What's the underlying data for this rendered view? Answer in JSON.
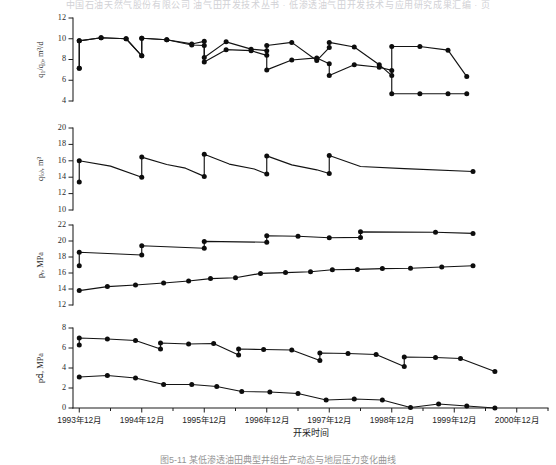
{
  "header": {
    "running_text": "中国石油天然气股份有限公司 油气田开发技术丛书 · 低渗透油气田开发技术与应用研究成果汇编 ·  页"
  },
  "figure": {
    "caption": "图5-11 某低渗透油田典型井组生产动态与地层压力变化曲线",
    "xaxis_title": "开采时间",
    "xtick_labels": [
      "1993年12月",
      "1994年12月",
      "1995年12月",
      "1996年12月",
      "1997年12月",
      "1998年12月",
      "1999年12月",
      "2000年12月"
    ]
  },
  "chart_data": [
    {
      "type": "line",
      "panel": 1,
      "title": "",
      "ylabel": "q₁/q₀,  m³/d",
      "xlabel": "",
      "ylim": [
        4,
        12
      ],
      "yticks": [
        4,
        6,
        8,
        10,
        12
      ],
      "xlim": [
        1993.9,
        2001.5
      ],
      "grid": false,
      "legend": "none",
      "x": [
        1994.0,
        1994.0,
        1994.35,
        1994.75,
        1995.0,
        1995.0,
        1995.4,
        1995.8,
        1996.0,
        1996.0,
        1996.35,
        1996.75,
        1997.0,
        1997.0,
        1997.4,
        1997.8,
        1998.0,
        1998.0,
        1998.4,
        1998.8,
        1999.0,
        1999.0,
        1999.45,
        1999.9,
        2000.2
      ],
      "series": [
        {
          "name": "upper",
          "values": [
            7.15,
            9.8,
            10.1,
            10.0,
            8.35,
            10.05,
            9.9,
            9.5,
            9.75,
            8.2,
            9.7,
            9.0,
            8.85,
            9.35,
            9.65,
            7.9,
            9.15,
            9.65,
            9.2,
            7.5,
            6.45,
            9.25,
            9.25,
            8.9,
            6.35
          ]
        },
        {
          "name": "lower",
          "values": [
            7.15,
            9.8,
            10.1,
            10.0,
            8.35,
            10.05,
            9.9,
            9.4,
            9.35,
            7.75,
            8.95,
            8.85,
            8.4,
            7.0,
            7.95,
            8.15,
            7.6,
            6.45,
            7.5,
            7.25,
            6.95,
            4.7,
            4.7,
            4.7,
            4.7
          ]
        }
      ]
    },
    {
      "type": "line",
      "panel": 2,
      "title": "",
      "ylabel": "q₍ₒ₎,  m³",
      "xlabel": "",
      "ylim": [
        10,
        20
      ],
      "yticks": [
        10,
        12,
        14,
        16,
        18,
        20
      ],
      "xlim": [
        1993.9,
        2001.5
      ],
      "grid": false,
      "legend": "none",
      "markers": [
        {
          "x": 1994.0,
          "y": 13.4
        },
        {
          "x": 1994.0,
          "y": 16.0
        },
        {
          "x": 1995.0,
          "y": 14.0
        },
        {
          "x": 1995.0,
          "y": 16.45
        },
        {
          "x": 1996.0,
          "y": 14.1
        },
        {
          "x": 1996.0,
          "y": 16.8
        },
        {
          "x": 1997.0,
          "y": 14.4
        },
        {
          "x": 1997.0,
          "y": 16.6
        },
        {
          "x": 1998.0,
          "y": 14.45
        },
        {
          "x": 1998.0,
          "y": 16.65
        },
        {
          "x": 2000.3,
          "y": 14.7
        }
      ],
      "path": [
        {
          "x": 1994.0,
          "y": 13.4
        },
        {
          "x": 1994.0,
          "y": 16.0
        },
        {
          "x": 1994.5,
          "y": 15.35
        },
        {
          "x": 1995.0,
          "y": 14.0
        },
        {
          "x": 1995.0,
          "y": 16.45
        },
        {
          "x": 1995.4,
          "y": 15.55
        },
        {
          "x": 1995.7,
          "y": 15.1
        },
        {
          "x": 1996.0,
          "y": 14.1
        },
        {
          "x": 1996.0,
          "y": 16.8
        },
        {
          "x": 1996.4,
          "y": 15.6
        },
        {
          "x": 1996.8,
          "y": 15.0
        },
        {
          "x": 1997.0,
          "y": 14.4
        },
        {
          "x": 1997.0,
          "y": 16.6
        },
        {
          "x": 1997.4,
          "y": 15.5
        },
        {
          "x": 1997.8,
          "y": 14.9
        },
        {
          "x": 1998.0,
          "y": 14.45
        },
        {
          "x": 1998.0,
          "y": 16.65
        },
        {
          "x": 1998.5,
          "y": 15.3
        },
        {
          "x": 1999.2,
          "y": 15.05
        },
        {
          "x": 2000.3,
          "y": 14.7
        }
      ]
    },
    {
      "type": "line",
      "panel": 3,
      "title": "",
      "ylabel": "pᵣ,  MPa",
      "xlabel": "",
      "ylim": [
        12,
        22
      ],
      "yticks": [
        12,
        14,
        16,
        18,
        20,
        22
      ],
      "xlim": [
        1993.9,
        2001.5
      ],
      "grid": false,
      "legend": "none",
      "series": [
        {
          "name": "upper-static-pressure",
          "points": [
            {
              "x": 1994.0,
              "y": 16.9
            },
            {
              "x": 1994.0,
              "y": 18.6
            },
            {
              "x": 1995.0,
              "y": 18.25
            },
            {
              "x": 1995.0,
              "y": 19.4
            },
            {
              "x": 1996.0,
              "y": 19.1
            },
            {
              "x": 1996.0,
              "y": 19.95
            },
            {
              "x": 1997.0,
              "y": 19.85
            },
            {
              "x": 1997.0,
              "y": 20.65
            },
            {
              "x": 1997.5,
              "y": 20.6
            },
            {
              "x": 1998.0,
              "y": 20.4
            },
            {
              "x": 1998.5,
              "y": 20.45
            },
            {
              "x": 1998.5,
              "y": 21.15
            },
            {
              "x": 1999.7,
              "y": 21.1
            },
            {
              "x": 2000.3,
              "y": 20.95
            }
          ]
        },
        {
          "name": "lower-flowing-pressure",
          "points": [
            {
              "x": 1994.0,
              "y": 13.8
            },
            {
              "x": 1994.45,
              "y": 14.3
            },
            {
              "x": 1994.9,
              "y": 14.5
            },
            {
              "x": 1995.35,
              "y": 14.75
            },
            {
              "x": 1995.75,
              "y": 15.0
            },
            {
              "x": 1996.1,
              "y": 15.3
            },
            {
              "x": 1996.5,
              "y": 15.4
            },
            {
              "x": 1996.9,
              "y": 15.95
            },
            {
              "x": 1997.3,
              "y": 16.05
            },
            {
              "x": 1997.7,
              "y": 16.15
            },
            {
              "x": 1998.05,
              "y": 16.4
            },
            {
              "x": 1998.45,
              "y": 16.45
            },
            {
              "x": 1998.85,
              "y": 16.55
            },
            {
              "x": 1999.3,
              "y": 16.6
            },
            {
              "x": 1999.8,
              "y": 16.75
            },
            {
              "x": 2000.3,
              "y": 16.9
            }
          ]
        }
      ]
    },
    {
      "type": "line",
      "panel": 4,
      "title": "",
      "ylabel": "p𝚍,  MPa",
      "xlabel": "开采时间",
      "ylim": [
        0,
        8
      ],
      "yticks": [
        0,
        2,
        4,
        6,
        8
      ],
      "xlim": [
        1993.9,
        2001.5
      ],
      "grid": false,
      "legend": "none",
      "series": [
        {
          "name": "upper-drawdown",
          "points": [
            {
              "x": 1994.0,
              "y": 6.3
            },
            {
              "x": 1994.0,
              "y": 7.0
            },
            {
              "x": 1994.45,
              "y": 6.9
            },
            {
              "x": 1994.9,
              "y": 6.75
            },
            {
              "x": 1995.3,
              "y": 5.9
            },
            {
              "x": 1995.3,
              "y": 6.5
            },
            {
              "x": 1995.75,
              "y": 6.4
            },
            {
              "x": 1996.15,
              "y": 6.45
            },
            {
              "x": 1996.55,
              "y": 5.3
            },
            {
              "x": 1996.55,
              "y": 5.9
            },
            {
              "x": 1996.95,
              "y": 5.85
            },
            {
              "x": 1997.4,
              "y": 5.8
            },
            {
              "x": 1997.85,
              "y": 4.75
            },
            {
              "x": 1997.85,
              "y": 5.5
            },
            {
              "x": 1998.3,
              "y": 5.45
            },
            {
              "x": 1998.75,
              "y": 5.35
            },
            {
              "x": 1999.2,
              "y": 4.15
            },
            {
              "x": 1999.2,
              "y": 5.1
            },
            {
              "x": 1999.7,
              "y": 5.05
            },
            {
              "x": 2000.1,
              "y": 4.95
            },
            {
              "x": 2000.65,
              "y": 3.65
            }
          ]
        },
        {
          "name": "lower-drawdown",
          "points": [
            {
              "x": 1994.0,
              "y": 3.1
            },
            {
              "x": 1994.45,
              "y": 3.25
            },
            {
              "x": 1994.9,
              "y": 3.0
            },
            {
              "x": 1995.35,
              "y": 2.35
            },
            {
              "x": 1995.8,
              "y": 2.35
            },
            {
              "x": 1996.2,
              "y": 2.15
            },
            {
              "x": 1996.6,
              "y": 1.65
            },
            {
              "x": 1997.05,
              "y": 1.6
            },
            {
              "x": 1997.5,
              "y": 1.45
            },
            {
              "x": 1997.95,
              "y": 0.8
            },
            {
              "x": 1998.4,
              "y": 0.9
            },
            {
              "x": 1998.85,
              "y": 0.8
            },
            {
              "x": 1999.3,
              "y": 0.05
            },
            {
              "x": 1999.75,
              "y": 0.4
            },
            {
              "x": 2000.2,
              "y": 0.2
            },
            {
              "x": 2000.65,
              "y": 0.0
            }
          ]
        }
      ]
    }
  ]
}
